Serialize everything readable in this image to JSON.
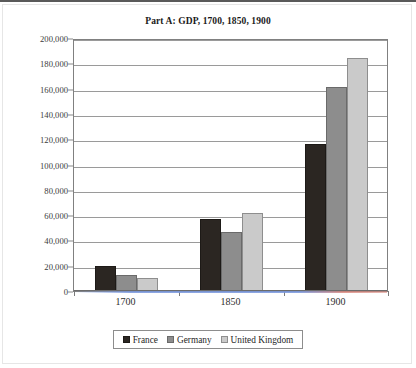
{
  "chart_data": {
    "type": "bar",
    "title": "Part A: GDP, 1700, 1850, 1900",
    "xlabel": "",
    "ylabel": "",
    "categories": [
      "1700",
      "1850",
      "1900"
    ],
    "series": [
      {
        "name": "France",
        "color": "#2b2622",
        "values": [
          19500,
          57000,
          116000
        ]
      },
      {
        "name": "Germany",
        "color": "#8d8d8d",
        "values": [
          13000,
          47000,
          161000
        ]
      },
      {
        "name": "United Kingdom",
        "color": "#cacaca",
        "values": [
          10500,
          62000,
          184000
        ]
      }
    ],
    "ylim": [
      0,
      200000
    ],
    "ytick_step": 20000,
    "ytick_labels": [
      "0",
      "20,000",
      "40,000",
      "60,000",
      "80,000",
      "100,000",
      "120,000",
      "140,000",
      "160,000",
      "180,000",
      "200,000"
    ],
    "ytick_values": [
      0,
      20000,
      40000,
      60000,
      80000,
      100000,
      120000,
      140000,
      160000,
      180000,
      200000
    ],
    "grid": true,
    "legend_position": "bottom"
  }
}
